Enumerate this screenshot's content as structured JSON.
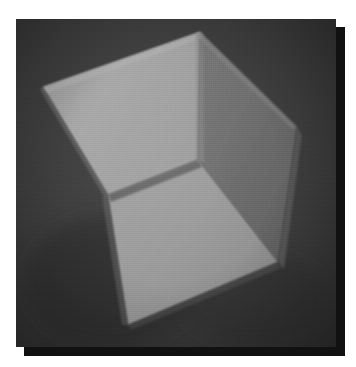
{
  "figure": {
    "kind": "3d-render",
    "caption": "",
    "canvas": {
      "width": 320,
      "height": 328,
      "background_color": "#3d3d3d",
      "shadow_color": "#111111",
      "shadow_offset_x": 8,
      "shadow_offset_y": 8,
      "page_background": "#ffffff"
    },
    "colors": {
      "background": "#3d3d3d",
      "background_dark": "#333333",
      "face_top_left_light": "#a3a3a3",
      "face_front_right": "#9a9a9a",
      "face_inner_shadow": "#6e6e6e",
      "face_inner_dark": "#5c5c5c",
      "face_right_side": "#636363",
      "edge_highlight": "#b4b4b4",
      "edge_dark": "#4a4a4a",
      "shadow": "#111111"
    },
    "vertices": {
      "top": [
        184,
        13
      ],
      "left": [
        27,
        68
      ],
      "right": [
        279,
        106
      ],
      "bottom": [
        112,
        306
      ],
      "center": [
        92,
        176
      ],
      "inner_top": [
        184,
        13
      ],
      "inner_mid": [
        182,
        141
      ],
      "inner_left": [
        27,
        68
      ],
      "front_bottom_right": [
        262,
        243
      ],
      "front_top_right": [
        279,
        106
      ],
      "rim_left_lower": [
        92,
        176
      ],
      "rim_bottom": [
        112,
        306
      ]
    },
    "faces": [
      {
        "name": "top-left-outer-wall",
        "fill": "#a3a3a3",
        "points": "27,68 184,13 182,141 92,176"
      },
      {
        "name": "inner-back-wall",
        "fill": "#6e6e6e",
        "points": "184,13 279,106 262,243 182,141"
      },
      {
        "name": "front-right-wall",
        "fill": "#9a9a9a",
        "points": "92,176 182,141 262,243 112,306"
      },
      {
        "name": "right-thin-side",
        "fill": "#5f5f5f",
        "points": "279,106 283,112 266,248 262,243"
      },
      {
        "name": "bottom-left-shadow",
        "fill": "#474747",
        "points": "27,68 92,176 112,306 27,230"
      }
    ]
  }
}
